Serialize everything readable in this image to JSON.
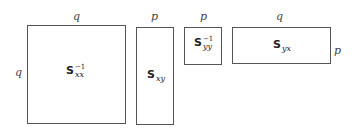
{
  "diagram": {
    "matrices": [
      {
        "name": "Sxx_inverse",
        "symbol": "S",
        "subscript": "xx",
        "superscript": "−1",
        "top_dim": "q",
        "side_dim": "q"
      },
      {
        "name": "Sxy",
        "symbol": "S",
        "subscript": "xy",
        "superscript": "",
        "top_dim": "p",
        "side_dim": ""
      },
      {
        "name": "Syy_inverse",
        "symbol": "S",
        "subscript": "yy",
        "superscript": "−1",
        "top_dim": "p",
        "side_dim": ""
      },
      {
        "name": "Syx",
        "symbol": "S",
        "subscript": "yx",
        "superscript": "",
        "top_dim": "q",
        "side_dim": "p"
      }
    ]
  }
}
